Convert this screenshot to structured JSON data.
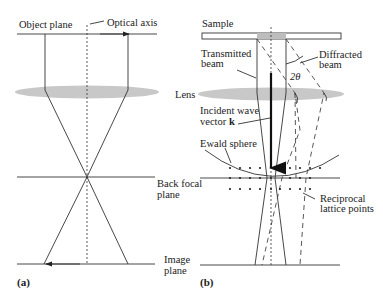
{
  "panel_a": {
    "tag": "(a)",
    "labels": {
      "object_plane": "Object plane",
      "optical_axis": "Optical axis",
      "lens": "Lens",
      "back_focal_plane_1": "Back focal",
      "back_focal_plane_2": "plane",
      "image_plane_1": "Image",
      "image_plane_2": "plane"
    }
  },
  "panel_b": {
    "tag": "(b)",
    "labels": {
      "sample": "Sample",
      "transmitted_1": "Transmitted",
      "transmitted_2": "beam",
      "diffracted_1": "Diffracted",
      "diffracted_2": "beam",
      "angle": "2θ",
      "incident_1": "Incident wave",
      "incident_2": "vector ",
      "incident_k": "k",
      "ewald": "Ewald sphere",
      "reciprocal_1": "Reciprocal",
      "reciprocal_2": "lattice points"
    }
  },
  "colors": {
    "lens": "#c8c8c8",
    "line": "#333333",
    "sample_highlight": "#bdbdbd"
  }
}
